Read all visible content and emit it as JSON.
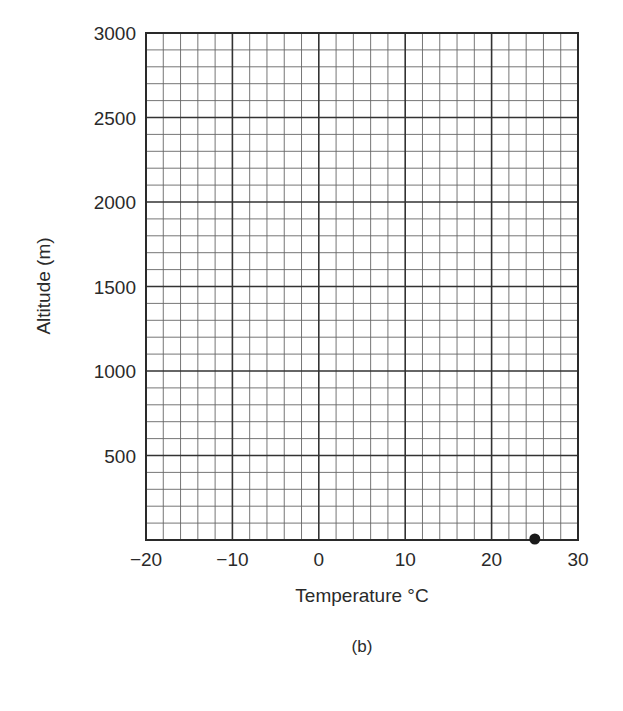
{
  "chart_data": {
    "type": "scatter",
    "title": "",
    "subtitle": "",
    "caption": "(b)",
    "xlabel": "Temperature °C",
    "ylabel": "Altitude (m)",
    "xlim": [
      -20,
      30
    ],
    "ylim": [
      0,
      3000
    ],
    "x_ticks": [
      -20,
      -10,
      0,
      10,
      20,
      30
    ],
    "x_tick_labels": [
      "−20",
      "−10",
      "0",
      "10",
      "20",
      "30"
    ],
    "y_ticks": [
      500,
      1000,
      1500,
      2000,
      2500,
      3000
    ],
    "y_tick_labels": [
      "500",
      "1000",
      "1500",
      "2000",
      "2500",
      "3000"
    ],
    "grid": true,
    "grid_minor_x_step": 2,
    "grid_minor_y_step": 100,
    "grid_major_x_step": 10,
    "grid_major_y_step": 500,
    "legend": null,
    "series": [
      {
        "name": "point",
        "points": [
          {
            "x": 25,
            "y": 0
          }
        ]
      }
    ]
  },
  "colors": {
    "ink": "#2a2a2a",
    "grid": "#555555",
    "background": "#ffffff"
  }
}
